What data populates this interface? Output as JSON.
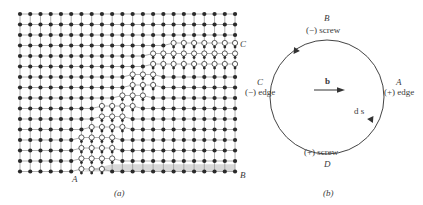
{
  "panel_a": {
    "caption": "(a)",
    "point_labels": {
      "A": "A",
      "B": "B",
      "C": "C"
    },
    "lattice": {
      "columns": 22,
      "rows": 16,
      "origin_x": 20,
      "origin_y": 14,
      "spacing_x": 10.24,
      "spacing_y": 10.5,
      "atom_color": "#2a2a2a",
      "line_color": "#9a9a9a",
      "open_atom_fill": "#ffffff",
      "shade_color": "#d8d8d8"
    },
    "displaced_band": [
      {
        "row": 3,
        "start": 15,
        "end": 21
      },
      {
        "row": 4,
        "start": 13,
        "end": 21
      },
      {
        "row": 5,
        "start": 13,
        "end": 21
      },
      {
        "row": 6,
        "start": 11,
        "end": 13
      },
      {
        "row": 7,
        "start": 11,
        "end": 13
      },
      {
        "row": 8,
        "start": 10,
        "end": 12
      },
      {
        "row": 9,
        "start": 8,
        "end": 11
      },
      {
        "row": 10,
        "start": 8,
        "end": 10
      },
      {
        "row": 11,
        "start": 7,
        "end": 10
      },
      {
        "row": 12,
        "start": 6,
        "end": 9
      },
      {
        "row": 13,
        "start": 6,
        "end": 9
      },
      {
        "row": 14,
        "start": 6,
        "end": 9
      },
      {
        "row": 15,
        "start": 6,
        "end": 8
      }
    ]
  },
  "panel_b": {
    "caption": "(b)",
    "burgers_vector_label": "b",
    "line_element_label": "d s",
    "points": [
      {
        "id": "B",
        "letter": "B",
        "type": "(−) screw",
        "position": "top"
      },
      {
        "id": "A",
        "letter": "A",
        "type": "(+) edge",
        "position": "right"
      },
      {
        "id": "D",
        "letter": "D",
        "type": "(+) screw",
        "position": "bottom"
      },
      {
        "id": "C",
        "letter": "C",
        "type": "(−) edge",
        "position": "left"
      }
    ],
    "circle": {
      "cx": 327,
      "cy": 97,
      "r": 57,
      "stroke": "#444444"
    },
    "direction": "counter-clockwise"
  }
}
